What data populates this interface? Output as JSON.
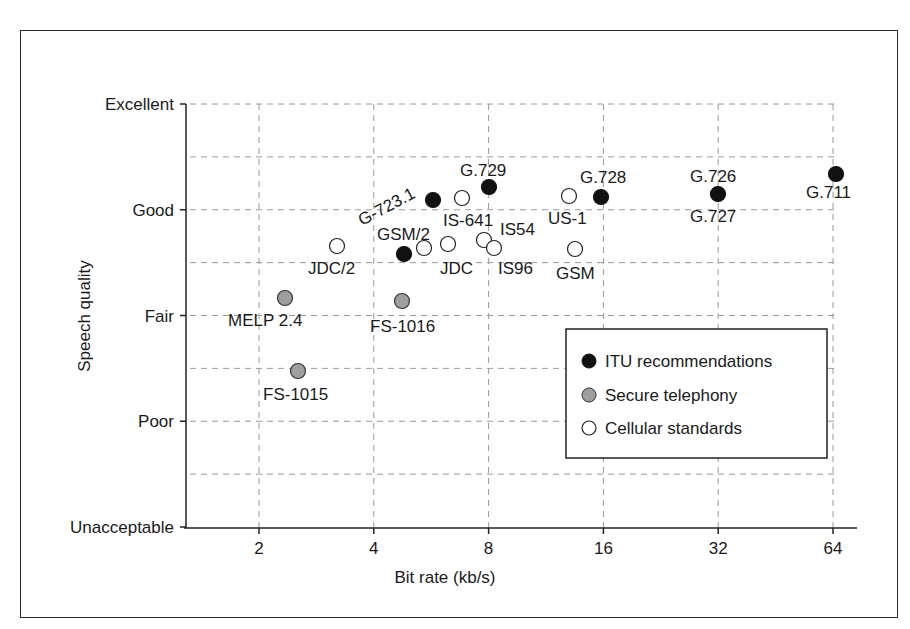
{
  "chart_data": {
    "type": "scatter",
    "title": "",
    "xlabel": "Bit rate (kb/s)",
    "ylabel": "Speech quality",
    "x_scale": "log2",
    "x_ticks": [
      2,
      4,
      8,
      16,
      32,
      64
    ],
    "x_tick_labels": [
      "2",
      "4",
      "8",
      "16",
      "32",
      "64"
    ],
    "y_ticks": [
      0,
      1,
      2,
      3,
      4
    ],
    "y_tick_labels": [
      "Unacceptable",
      "Poor",
      "Fair",
      "Good",
      "Excellent"
    ],
    "ylim": [
      0,
      4
    ],
    "grid": true,
    "legend_position": "lower right (inside)",
    "legend": [
      {
        "name": "ITU recommendations",
        "marker": "filled-black-circle",
        "color": "#111111"
      },
      {
        "name": "Secure telephony",
        "marker": "gray-circle",
        "color": "#9e9e9e"
      },
      {
        "name": "Cellular standards",
        "marker": "open-circle",
        "color": "#ffffff"
      }
    ],
    "series": [
      {
        "name": "ITU recommendations",
        "points": [
          {
            "label": "G.711",
            "x": 64,
            "y": 3.33
          },
          {
            "label": "G.726 / G.727",
            "x": 32,
            "y": 3.12
          },
          {
            "label": "G.728",
            "x": 16,
            "y": 3.1
          },
          {
            "label": "G.729",
            "x": 8,
            "y": 3.2
          },
          {
            "label": "G.723.1",
            "x": 5.9,
            "y": 3.07
          },
          {
            "label": "GSM/2",
            "x": 5.6,
            "y": 2.56
          }
        ]
      },
      {
        "name": "Secure telephony",
        "points": [
          {
            "label": "MELP 2.4",
            "x": 2.4,
            "y": 2.14
          },
          {
            "label": "FS-1016",
            "x": 4.8,
            "y": 2.11
          },
          {
            "label": "FS-1015",
            "x": 2.4,
            "y": 1.44
          }
        ]
      },
      {
        "name": "Cellular standards",
        "points": [
          {
            "label": "IS-641",
            "x": 7.4,
            "y": 3.09
          },
          {
            "label": "US-1",
            "x": 12.2,
            "y": 3.11
          },
          {
            "label": "GSM",
            "x": 13,
            "y": 2.6
          },
          {
            "label": "IS54",
            "x": 7.95,
            "y": 2.67
          },
          {
            "label": "IS96",
            "x": 8.5,
            "y": 2.6
          },
          {
            "label": "JDC",
            "x": 6.7,
            "y": 2.64
          },
          {
            "label": "GSM/2",
            "x": 5.6,
            "y": 2.62
          },
          {
            "label": "JDC/2",
            "x": 3.2,
            "y": 2.62
          }
        ]
      }
    ]
  },
  "render": {
    "markers": [
      {
        "cls": "itu",
        "cx": 836,
        "cy": 174
      },
      {
        "cls": "itu",
        "cx": 718,
        "cy": 194
      },
      {
        "cls": "itu",
        "cx": 601,
        "cy": 197
      },
      {
        "cls": "itu",
        "cx": 489,
        "cy": 187
      },
      {
        "cls": "itu",
        "cx": 433,
        "cy": 200
      },
      {
        "cls": "itu",
        "cx": 404,
        "cy": 254
      },
      {
        "cls": "sec",
        "cx": 285,
        "cy": 298
      },
      {
        "cls": "sec",
        "cx": 402,
        "cy": 301
      },
      {
        "cls": "sec",
        "cx": 298,
        "cy": 371
      },
      {
        "cls": "cell",
        "cx": 462,
        "cy": 198
      },
      {
        "cls": "cell",
        "cx": 569,
        "cy": 196
      },
      {
        "cls": "cell",
        "cx": 575,
        "cy": 249
      },
      {
        "cls": "cell",
        "cx": 484,
        "cy": 240
      },
      {
        "cls": "cell",
        "cx": 494,
        "cy": 248
      },
      {
        "cls": "cell",
        "cx": 448,
        "cy": 244
      },
      {
        "cls": "cell",
        "cx": 424,
        "cy": 248
      },
      {
        "cls": "cell",
        "cx": 337,
        "cy": 246
      }
    ],
    "labels": [
      {
        "text": "G.711",
        "x": 806,
        "y": 198,
        "rot": 0
      },
      {
        "text": "G.726",
        "x": 690,
        "y": 182,
        "rot": 0
      },
      {
        "text": "G.727",
        "x": 690,
        "y": 222,
        "rot": 0
      },
      {
        "text": "G.728",
        "x": 580,
        "y": 183,
        "rot": 0
      },
      {
        "text": "G.729",
        "x": 460,
        "y": 176,
        "rot": 0
      },
      {
        "text": "G-723.1",
        "x": 362,
        "y": 226,
        "rot": -28
      },
      {
        "text": "IS-641",
        "x": 443,
        "y": 226,
        "rot": 0
      },
      {
        "text": "US-1",
        "x": 548,
        "y": 224,
        "rot": 0
      },
      {
        "text": "IS54",
        "x": 500,
        "y": 235,
        "rot": 0
      },
      {
        "text": "GSM/2",
        "x": 377,
        "y": 240,
        "rot": 0
      },
      {
        "text": "JDC/2",
        "x": 308,
        "y": 274,
        "rot": 0
      },
      {
        "text": "JDC",
        "x": 440,
        "y": 274,
        "rot": 0
      },
      {
        "text": "IS96",
        "x": 498,
        "y": 274,
        "rot": 0
      },
      {
        "text": "GSM",
        "x": 556,
        "y": 279,
        "rot": 0
      },
      {
        "text": "MELP 2.4",
        "x": 228,
        "y": 326,
        "rot": 0
      },
      {
        "text": "FS-1016",
        "x": 370,
        "y": 332,
        "rot": 0
      },
      {
        "text": "FS-1015",
        "x": 263,
        "y": 400,
        "rot": 0
      }
    ]
  }
}
